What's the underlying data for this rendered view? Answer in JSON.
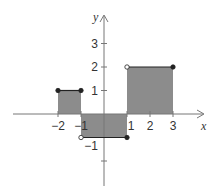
{
  "chart_data": {
    "type": "step",
    "title": "",
    "xlabel": "x",
    "ylabel": "y",
    "xlim": [
      -4,
      4.5
    ],
    "ylim": [
      -3,
      4
    ],
    "grid": false,
    "x_ticks": [
      -2,
      -1,
      1,
      2,
      3
    ],
    "x_tick_labels": [
      "−2",
      "−1",
      "1",
      "2",
      "3"
    ],
    "y_ticks": [
      3,
      2,
      1,
      -1,
      -2
    ],
    "y_tick_labels": [
      "3",
      "2",
      "1",
      "−1",
      ""
    ],
    "segments": [
      {
        "x_start": -2,
        "x_end": -1,
        "y": 1,
        "start_point": "closed",
        "end_point": "closed"
      },
      {
        "x_start": -1,
        "x_end": 1,
        "y": -1,
        "start_point": "open",
        "end_point": "closed"
      },
      {
        "x_start": 1,
        "x_end": 3,
        "y": 2,
        "start_point": "open",
        "end_point": "closed"
      }
    ],
    "shaded_regions": [
      {
        "x": [
          -2,
          -1
        ],
        "y": [
          0,
          1
        ]
      },
      {
        "x": [
          -1,
          1
        ],
        "y": [
          -1,
          0
        ]
      },
      {
        "x": [
          1,
          3
        ],
        "y": [
          0,
          2
        ]
      }
    ],
    "colors": {
      "fill": "#8c8c8c",
      "axis": "#777777",
      "line": "#222222",
      "text": "#333333"
    }
  }
}
